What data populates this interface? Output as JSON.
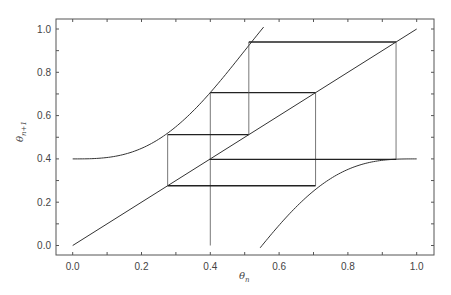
{
  "chart_data": {
    "type": "line",
    "title": "",
    "xlabel": "θ_n",
    "ylabel": "θ_{n+1}",
    "xlim": [
      -0.05,
      1.05
    ],
    "ylim": [
      -0.05,
      1.05
    ],
    "grid": false,
    "legend": null,
    "x_ticks": [
      "0.0",
      "0.2",
      "0.4",
      "0.6",
      "0.8",
      "1.0"
    ],
    "y_ticks": [
      "0.0",
      "0.2",
      "0.4",
      "0.6",
      "0.8",
      "1.0"
    ],
    "series": [
      {
        "name": "map",
        "description": "circle map θ_{n+1} = θ_n + 0.4 − (1/2π) sin(2πθ_n) mod 1",
        "branches": [
          {
            "x": [
              0.0,
              0.1,
              0.2,
              0.27,
              0.3,
              0.4,
              0.5,
              0.52,
              0.55
            ],
            "y": [
              0.4,
              0.407,
              0.449,
              0.512,
              0.548,
              0.706,
              0.9,
              0.94,
              0.976
            ]
          },
          {
            "x": [
              0.55,
              0.6,
              0.7,
              0.72,
              0.8,
              0.9,
              0.94,
              1.0
            ],
            "y": [
              0.026,
              0.094,
              0.251,
              0.276,
              0.351,
              0.394,
              0.398,
              0.4
            ]
          }
        ]
      },
      {
        "name": "identity",
        "x": [
          0.0,
          1.0
        ],
        "y": [
          0.0,
          1.0
        ]
      },
      {
        "name": "cobweb",
        "x": [
          0.4,
          0.4,
          0.706,
          0.706,
          0.276,
          0.276,
          0.512,
          0.512,
          0.94,
          0.94,
          0.398
        ],
        "y": [
          0.0,
          0.706,
          0.706,
          0.276,
          0.276,
          0.512,
          0.512,
          0.94,
          0.94,
          0.398,
          0.398
        ]
      }
    ]
  },
  "labels": {
    "xlabel_main": "θ",
    "xlabel_sub": "n",
    "ylabel_main": "θ",
    "ylabel_sub": "n+1",
    "xticks": [
      "0.0",
      "0.2",
      "0.4",
      "0.6",
      "0.8",
      "1.0"
    ],
    "yticks": [
      "0.0",
      "0.2",
      "0.4",
      "0.6",
      "0.8",
      "1.0"
    ]
  }
}
